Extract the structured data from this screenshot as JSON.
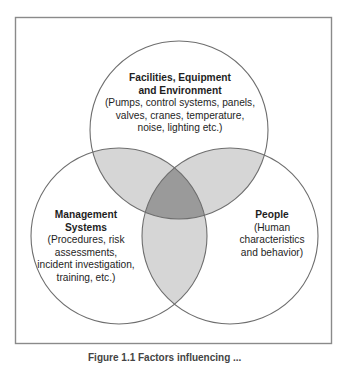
{
  "diagram": {
    "type": "venn",
    "sets": [
      {
        "id": "facilities",
        "title": "Facilities, Equipment and Environment",
        "title_line1": "Facilities, Equipment",
        "title_line2": "and Environment",
        "desc_line1": "(Pumps, control systems, panels,",
        "desc_line2": "valves, cranes, temperature,",
        "desc_line3": "noise, lighting etc.)"
      },
      {
        "id": "management",
        "title": "Management Systems",
        "title_line1": "Management",
        "title_line2": "Systems",
        "desc_line1": "(Procedures, risk",
        "desc_line2": "assessments,",
        "desc_line3": "incident investigation,",
        "desc_line4": "training, etc.)"
      },
      {
        "id": "people",
        "title": "People",
        "title_line1": "People",
        "desc_line1": "(Human",
        "desc_line2": "characteristics",
        "desc_line3": "and behavior)"
      }
    ],
    "colors": {
      "frame": "#8a8a8a",
      "circle_stroke": "#6e6e6e",
      "pair_overlap": "#d6d6d6",
      "triple_overlap": "#9a9a9a",
      "background": "#ffffff"
    }
  },
  "caption": "Figure 1.1  Factors influencing ..."
}
